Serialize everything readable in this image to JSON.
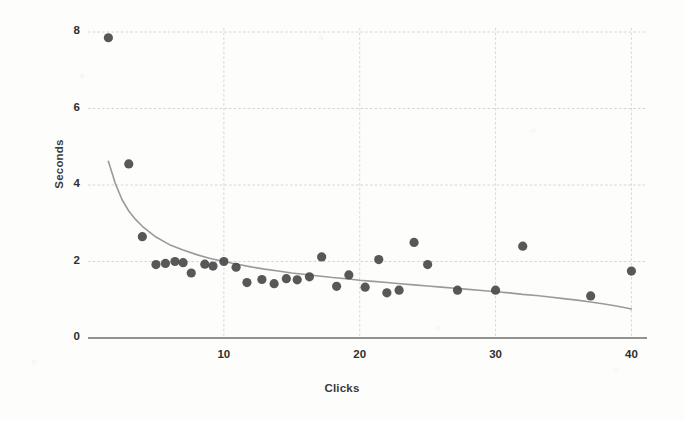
{
  "chart_data": {
    "type": "scatter",
    "title": "",
    "xlabel": "Clicks",
    "ylabel": "Seconds",
    "xlim": [
      0,
      41
    ],
    "ylim": [
      0,
      8.6
    ],
    "xticks": [
      10,
      20,
      30,
      40
    ],
    "xtick_labels": [
      "10",
      "20",
      "30",
      "40"
    ],
    "yticks": [
      0,
      2,
      4,
      6,
      8
    ],
    "ytick_labels": [
      "0",
      "2",
      "4",
      "6",
      "8"
    ],
    "grid": true,
    "grid_style": "dashed",
    "legend": "none",
    "series": [
      {
        "name": "observations",
        "type": "scatter",
        "marker": "filled-circle",
        "color": "#4a4a4a",
        "points": [
          [
            1.5,
            7.85
          ],
          [
            3.0,
            4.55
          ],
          [
            4.0,
            2.65
          ],
          [
            5.0,
            1.92
          ],
          [
            5.7,
            1.95
          ],
          [
            6.4,
            2.0
          ],
          [
            7.0,
            1.97
          ],
          [
            7.6,
            1.7
          ],
          [
            8.6,
            1.93
          ],
          [
            9.2,
            1.88
          ],
          [
            10.0,
            2.0
          ],
          [
            10.9,
            1.85
          ],
          [
            11.7,
            1.45
          ],
          [
            12.8,
            1.53
          ],
          [
            13.7,
            1.42
          ],
          [
            14.6,
            1.55
          ],
          [
            15.4,
            1.52
          ],
          [
            16.3,
            1.6
          ],
          [
            17.2,
            2.12
          ],
          [
            18.3,
            1.35
          ],
          [
            19.2,
            1.65
          ],
          [
            20.4,
            1.33
          ],
          [
            21.4,
            2.05
          ],
          [
            22.0,
            1.18
          ],
          [
            22.9,
            1.25
          ],
          [
            24.0,
            2.5
          ],
          [
            25.0,
            1.92
          ],
          [
            27.2,
            1.25
          ],
          [
            30.0,
            1.25
          ],
          [
            32.0,
            2.4
          ],
          [
            37.0,
            1.1
          ],
          [
            40.0,
            1.75
          ]
        ]
      },
      {
        "name": "fitted-decay-curve",
        "type": "line",
        "color": "#9a9a9a",
        "points": [
          [
            1.5,
            4.62
          ],
          [
            2.0,
            4.05
          ],
          [
            2.5,
            3.62
          ],
          [
            3.0,
            3.32
          ],
          [
            3.5,
            3.1
          ],
          [
            4.0,
            2.92
          ],
          [
            5.0,
            2.64
          ],
          [
            6.0,
            2.44
          ],
          [
            7.0,
            2.3
          ],
          [
            8.0,
            2.18
          ],
          [
            9.0,
            2.08
          ],
          [
            10.0,
            2.0
          ],
          [
            11.0,
            1.93
          ],
          [
            12.0,
            1.86
          ],
          [
            13.0,
            1.8
          ],
          [
            14.0,
            1.75
          ],
          [
            15.0,
            1.7
          ],
          [
            16.0,
            1.66
          ],
          [
            17.0,
            1.62
          ],
          [
            18.0,
            1.58
          ],
          [
            19.0,
            1.55
          ],
          [
            20.0,
            1.51
          ],
          [
            21.0,
            1.48
          ],
          [
            22.0,
            1.45
          ],
          [
            23.0,
            1.42
          ],
          [
            24.0,
            1.39
          ],
          [
            25.0,
            1.36
          ],
          [
            26.0,
            1.33
          ],
          [
            27.0,
            1.3
          ],
          [
            28.0,
            1.27
          ],
          [
            29.0,
            1.24
          ],
          [
            30.0,
            1.21
          ],
          [
            31.0,
            1.18
          ],
          [
            32.0,
            1.14
          ],
          [
            33.0,
            1.11
          ],
          [
            34.0,
            1.07
          ],
          [
            35.0,
            1.03
          ],
          [
            36.0,
            0.99
          ],
          [
            37.0,
            0.94
          ],
          [
            38.0,
            0.89
          ],
          [
            39.0,
            0.83
          ],
          [
            40.0,
            0.76
          ]
        ]
      }
    ]
  },
  "colors": {
    "marker": "#4a4a4a",
    "curve": "#9a9a9a",
    "axis": "#6e6e6e",
    "grid": "#c9c9c9",
    "text": "#2f2f2f",
    "background": "#fdfdfc"
  }
}
